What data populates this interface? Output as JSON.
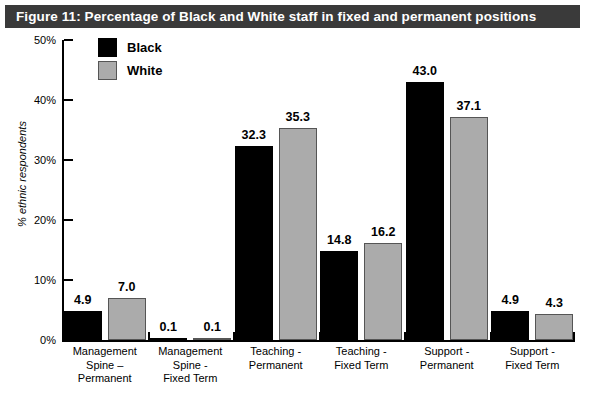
{
  "title": "Figure 11: Percentage of Black and White staff in fixed and permanent positions",
  "colors": {
    "banner_background": "#3A3A3A",
    "banner_text": "#FFFFFF",
    "series_black": "#000000",
    "series_white": "#ABABAB",
    "axis": "#000000",
    "page_background": "#FFFFFF"
  },
  "legend": {
    "position": "top-left-inside",
    "entries": [
      {
        "label": "Black",
        "swatch": "black-swatch"
      },
      {
        "label": "White",
        "swatch": "white-swatch"
      }
    ]
  },
  "chart_data": {
    "type": "bar",
    "title": "Figure 11: Percentage of Black and White staff in fixed and permanent positions",
    "xlabel": "",
    "ylabel": "% ethnic respondents",
    "ylim": [
      0,
      50
    ],
    "yticks": [
      0,
      10,
      20,
      30,
      40,
      50
    ],
    "ytick_labels": [
      "0%",
      "10%",
      "20%",
      "30%",
      "40%",
      "50%"
    ],
    "grid": false,
    "legend": [
      "Black",
      "White"
    ],
    "categories": [
      "Management\nSpine –\nPermanent",
      "Management\nSpine -\nFixed Term",
      "Teaching -\nPermanent",
      "Teaching -\nFixed Term",
      "Support -\nPermanent",
      "Support -\nFixed Term"
    ],
    "series": [
      {
        "name": "Black",
        "values": [
          4.9,
          0.1,
          32.3,
          14.8,
          43.0,
          4.9
        ],
        "data_labels": [
          "4.9",
          "0.1",
          "32.3",
          "14.8",
          "43.0",
          "4.9"
        ]
      },
      {
        "name": "White",
        "values": [
          7.0,
          0.1,
          35.3,
          16.2,
          37.1,
          4.3
        ],
        "data_labels": [
          "7.0",
          "0.1",
          "35.3",
          "16.2",
          "37.1",
          "4.3"
        ]
      }
    ]
  }
}
